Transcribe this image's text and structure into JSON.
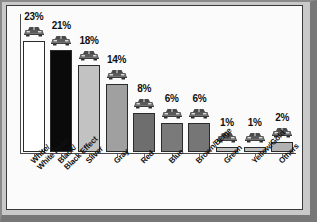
{
  "chart_data": {
    "type": "bar",
    "title": "",
    "subtitle": "",
    "xlabel": "",
    "ylabel": "",
    "ylim": [
      0,
      25
    ],
    "grid": false,
    "legend": "none",
    "categories": [
      "White/\nWhite Pearl",
      "Black/\nBlack Effect",
      "Silver",
      "Gray",
      "Red",
      "Blue",
      "Brown/Beige",
      "Green",
      "Yellow/Gold",
      "Others"
    ],
    "values": [
      23,
      21,
      18,
      14,
      8,
      6,
      6,
      1,
      1,
      2
    ],
    "data_labels": [
      "23%",
      "21%",
      "18%",
      "14%",
      "8%",
      "6%",
      "6%",
      "1%",
      "1%",
      "2%"
    ],
    "bar_colors": [
      "#ffffff",
      "#0a0a0a",
      "#c2c2c2",
      "#a0a0a0",
      "#6e6e6e",
      "#7a7a7a",
      "#767676",
      "#bdbdbd",
      "#bdbdbd",
      "#b2b2b2"
    ],
    "marker_icon": "car-icon",
    "axis_color": "#4a4a4a",
    "panel_color": "#fbfbfb",
    "frame_color": "#c9c9c9"
  }
}
